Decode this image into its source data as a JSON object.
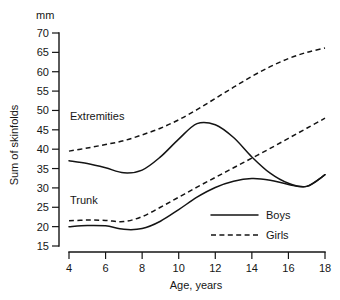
{
  "chart_data": {
    "type": "line",
    "title": "",
    "subtitle": "",
    "xlabel": "Age, years",
    "ylabel": "Sum of skinfolds",
    "unit_label": "mm",
    "xlim": [
      4,
      18
    ],
    "ylim": [
      15,
      70
    ],
    "xticks": [
      4,
      6,
      8,
      10,
      12,
      14,
      16,
      18
    ],
    "yticks": [
      15,
      20,
      25,
      30,
      35,
      40,
      45,
      50,
      55,
      60,
      65,
      70
    ],
    "xtick_labels": [
      "4",
      "6",
      "8",
      "10",
      "12",
      "14",
      "16",
      "18"
    ],
    "ytick_labels": [
      "15",
      "20",
      "25",
      "30",
      "35",
      "40",
      "45",
      "50",
      "55",
      "60",
      "65",
      "70"
    ],
    "grid": false,
    "legend_position": "inside bottom-right",
    "legend": [
      {
        "name": "Boys",
        "style": "solid"
      },
      {
        "name": "Girls",
        "style": "dashed"
      }
    ],
    "annotations": [
      {
        "text": "Extremities",
        "x": 5.2,
        "y": 48.5
      },
      {
        "text": "Trunk",
        "x": 5.2,
        "y": 26.0
      }
    ],
    "x": [
      4,
      5,
      6,
      7,
      8,
      9,
      10,
      11,
      12,
      13,
      14,
      15,
      16,
      17,
      18
    ],
    "series": [
      {
        "name": "Extremities, Boys",
        "group": "Extremities",
        "sex": "Boys",
        "style": "solid",
        "color": "#141414",
        "values": [
          37.0,
          36.3,
          35.2,
          33.9,
          34.6,
          38.0,
          42.6,
          46.6,
          46.3,
          43.0,
          38.0,
          33.8,
          31.2,
          30.4,
          33.4
        ]
      },
      {
        "name": "Extremities, Girls",
        "group": "Extremities",
        "sex": "Girls",
        "style": "dashed",
        "color": "#141414",
        "values": [
          39.5,
          40.3,
          41.2,
          42.2,
          43.7,
          45.4,
          47.6,
          50.2,
          53.1,
          56.0,
          58.8,
          61.3,
          63.4,
          65.0,
          66.1
        ]
      },
      {
        "name": "Trunk, Boys",
        "group": "Trunk",
        "sex": "Boys",
        "style": "solid",
        "color": "#141414",
        "values": [
          20.0,
          20.3,
          20.2,
          19.3,
          19.5,
          21.4,
          24.4,
          27.6,
          30.1,
          31.7,
          32.4,
          32.0,
          30.9,
          30.4,
          33.4
        ]
      },
      {
        "name": "Trunk, Girls",
        "group": "Trunk",
        "sex": "Girls",
        "style": "dashed",
        "color": "#141414",
        "values": [
          21.5,
          21.7,
          21.6,
          21.3,
          22.6,
          25.0,
          27.6,
          30.2,
          32.7,
          35.2,
          37.7,
          40.2,
          42.8,
          45.4,
          48.0
        ]
      }
    ]
  },
  "axes": {
    "unit_label": "mm",
    "ylabel": "Sum of skinfolds",
    "xlabel": "Age, years"
  },
  "legend": {
    "boys_label": "Boys",
    "girls_label": "Girls"
  },
  "annotations": {
    "extremities_label": "Extremities",
    "trunk_label": "Trunk"
  }
}
